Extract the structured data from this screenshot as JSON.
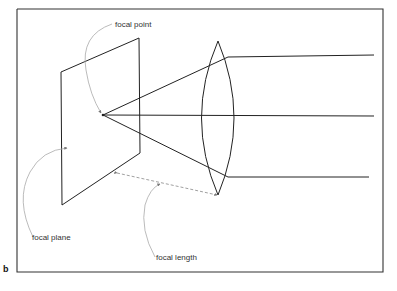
{
  "figure": {
    "panel_label": "b",
    "labels": {
      "focal_point": "focal point",
      "focal_plane": "focal plane",
      "focal_length": "focal length"
    },
    "colors": {
      "line": "#222222",
      "annotation": "#999999",
      "frame": "#333333"
    }
  }
}
